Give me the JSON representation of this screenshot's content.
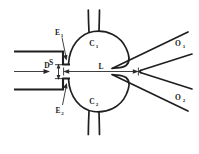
{
  "figure": {
    "type": "schematic-diagram",
    "background_color": "#ffffff",
    "line_color": "#1f1f1f",
    "label_color": "#1a1a1a"
  },
  "labels": {
    "supply": {
      "base": "S",
      "sub": "",
      "full": "S"
    },
    "nozzle_width": {
      "base": "D",
      "sub": "",
      "full": "D"
    },
    "splitter_distance": {
      "base": "L",
      "sub": "",
      "full": "L"
    },
    "edge_upper": {
      "base": "E",
      "sub": "1",
      "full": "E1"
    },
    "edge_lower": {
      "base": "E",
      "sub": "2",
      "full": "E2"
    },
    "chamber_upper": {
      "base": "C",
      "sub": "1",
      "full": "C1"
    },
    "chamber_lower": {
      "base": "C",
      "sub": "2",
      "full": "C2"
    },
    "output_upper": {
      "base": "O",
      "sub": "1",
      "full": "O1"
    },
    "output_lower": {
      "base": "O",
      "sub": "2",
      "full": "O2"
    }
  },
  "annotations": {
    "supply_arrow": "horizontal arrow pointing right indicating supply jet flow",
    "nozzle_dimension": "vertical double-headed dimension arrow for nozzle width D",
    "splitter_dimension": "horizontal double-headed dimension arrow for splitter distance L",
    "edge_upper_pointer": "leader arrow pointing down-right to upper nozzle edge",
    "edge_lower_pointer": "leader arrow pointing up-right to lower nozzle edge"
  }
}
